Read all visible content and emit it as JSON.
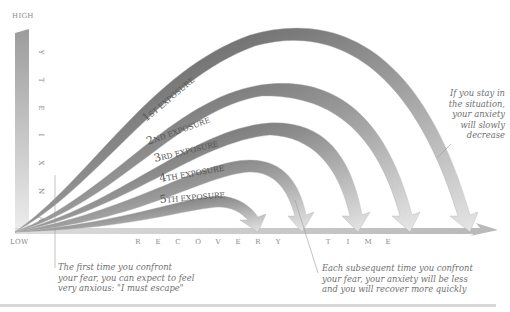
{
  "axes": {
    "y_high": "HIGH",
    "y_low": "LOW",
    "y_label_letters": [
      "A",
      "N",
      "X",
      "I",
      "E",
      "T",
      "Y"
    ],
    "x_label_letters": [
      "R",
      "E",
      "C",
      "O",
      "V",
      "E",
      "R",
      "Y",
      "",
      "T",
      "I",
      "M",
      "E"
    ]
  },
  "curves": [
    {
      "label_main": "1",
      "label_suffix": "ST EXPOSURE"
    },
    {
      "label_main": "2",
      "label_suffix": "ND EXPOSURE"
    },
    {
      "label_main": "3",
      "label_suffix": "RD EXPOSURE"
    },
    {
      "label_main": "4",
      "label_suffix": "TH EXPOSURE"
    },
    {
      "label_main": "5",
      "label_suffix": "TH EXPOSURE"
    }
  ],
  "annotations": {
    "first_time": [
      "The first time you confront",
      "your fear, you can expect to feel",
      "very anxious: \"I must escape\""
    ],
    "subsequent": [
      "Each subsequent time you confront",
      "your fear, your anxiety will be less",
      "and you will recover more quickly"
    ],
    "stay": [
      "If you stay in",
      "the situation,",
      "your anxiety",
      "will slowly",
      "decrease"
    ]
  },
  "colors": {
    "ribbon_dark": "#5a5a5a",
    "ribbon_mid": "#9a9a9a",
    "ribbon_light": "#e2e2e2",
    "text": "#7a7a7a",
    "note_text": "#6f6f6f"
  }
}
